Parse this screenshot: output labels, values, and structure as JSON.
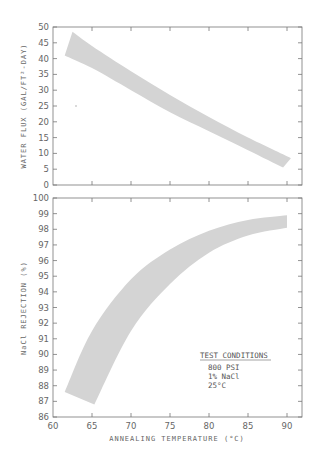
{
  "chart_data": [
    {
      "type": "area",
      "title": "",
      "xlabel": "ANNEALING TEMPERATURE (°C)",
      "ylabel": "WATER FLUX (GAL/FT²-DAY)",
      "xlim": [
        60,
        92
      ],
      "ylim": [
        0,
        50
      ],
      "yticks": [
        0,
        5,
        10,
        15,
        20,
        25,
        30,
        35,
        40,
        45,
        50
      ],
      "xticks": [
        60,
        65,
        70,
        75,
        80,
        85,
        90
      ],
      "grid": false,
      "series": [
        {
          "name": "upper bound",
          "x": [
            62.5,
            65,
            70,
            75,
            80,
            85,
            90.5
          ],
          "values": [
            48.5,
            44,
            36,
            28.5,
            21.5,
            15,
            8.5
          ]
        },
        {
          "name": "lower bound",
          "x": [
            61.5,
            65,
            70,
            75,
            80,
            85,
            89.5
          ],
          "values": [
            41,
            37,
            30,
            23,
            17,
            11,
            5.5
          ]
        }
      ],
      "annotations": []
    },
    {
      "type": "area",
      "title": "",
      "xlabel": "ANNEALING TEMPERATURE (°C)",
      "ylabel": "NaCl REJECTION (%)",
      "xlim": [
        60,
        92
      ],
      "ylim": [
        86,
        100
      ],
      "yticks": [
        86,
        87,
        88,
        89,
        90,
        91,
        92,
        93,
        94,
        95,
        96,
        97,
        98,
        99,
        100
      ],
      "xticks": [
        60,
        65,
        70,
        75,
        80,
        85,
        90
      ],
      "grid": false,
      "series": [
        {
          "name": "upper bound",
          "x": [
            61.5,
            65,
            70,
            75,
            80,
            85,
            90
          ],
          "values": [
            87.6,
            91.5,
            94.8,
            96.7,
            97.9,
            98.6,
            98.9
          ]
        },
        {
          "name": "lower bound",
          "x": [
            65.3,
            70,
            75,
            80,
            85,
            90
          ],
          "values": [
            86.8,
            91.5,
            94.5,
            96.5,
            97.6,
            98.1
          ]
        }
      ],
      "annotations": [
        {
          "text": "TEST CONDITIONS",
          "underline": true
        },
        {
          "text": "800 PSI"
        },
        {
          "text": "1% NaCl"
        },
        {
          "text": "25°C"
        }
      ]
    }
  ],
  "top_chart": {
    "ylabel": "WATER FLUX (GAL/FT²-DAY)",
    "yticks": [
      "0",
      "5",
      "10",
      "15",
      "20",
      "25",
      "30",
      "35",
      "40",
      "45",
      "50"
    ]
  },
  "bottom_chart": {
    "ylabel": "NaCl REJECTION (%)",
    "yticks": [
      "86",
      "87",
      "88",
      "89",
      "90",
      "91",
      "92",
      "93",
      "94",
      "95",
      "96",
      "97",
      "98",
      "99",
      "100"
    ],
    "xticks": [
      "60",
      "65",
      "70",
      "75",
      "80",
      "85",
      "90"
    ],
    "xlabel": "ANNEALING TEMPERATURE (°C)",
    "conditions": {
      "title": "TEST CONDITIONS",
      "lines": [
        "800 PSI",
        "1% NaCl",
        "25°C"
      ]
    }
  },
  "colors": {
    "band": "#d4d4d4",
    "axis": "#777777"
  }
}
